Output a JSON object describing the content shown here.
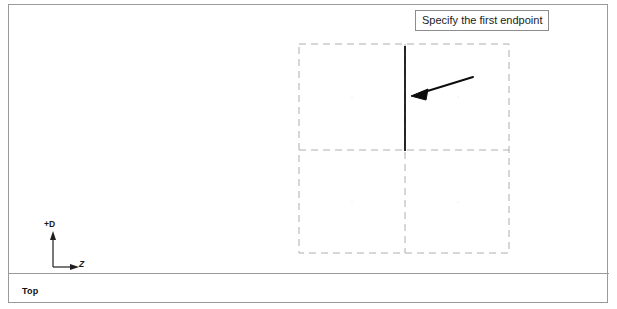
{
  "window": {
    "background_color": "#ffffff",
    "border_color": "#9a9a9a"
  },
  "prompt": {
    "text": "Specify the first endpoint",
    "border_color": "#8d8d8d",
    "background_color": "#ffffff"
  },
  "viewport": {
    "view_label": "Top",
    "axis": {
      "vertical_label": "+D",
      "horizontal_label": "Z"
    }
  },
  "drawing": {
    "grid": {
      "style": "dashed",
      "color": "#aeaeae",
      "columns": 2,
      "rows": 2,
      "left": 298,
      "top": 43,
      "right": 508,
      "bottom": 252,
      "mid_x": 404,
      "mid_y": 149
    },
    "entities": [
      {
        "name": "vertical-line-segment",
        "type": "line",
        "color": "#111111",
        "x1": 404,
        "y1": 45,
        "x2": 404,
        "y2": 150,
        "width": 1.8
      },
      {
        "name": "pointer-arrow",
        "type": "arrow",
        "color": "#0d0d0d",
        "tail_x": 472,
        "tail_y": 76,
        "head_x": 411,
        "head_y": 95,
        "width": 2
      }
    ]
  }
}
